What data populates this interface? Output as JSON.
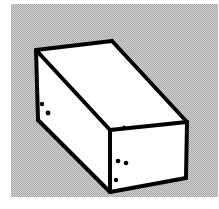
{
  "figure": {
    "subject_name": "rectangular-cuboid",
    "style": "black-ink-outline-on-halftone-gray",
    "canvas": {
      "width": 219,
      "height": 209
    },
    "colors": {
      "page_background": "#ffffff",
      "plate_background": "#c9c9c9",
      "halftone_dot": "#a8a8a8",
      "outline": "#000000",
      "face_fill": "#ffffff",
      "speckle": "#000000"
    },
    "plate": {
      "x": 11,
      "y": 4,
      "width": 207,
      "height": 193
    },
    "outline_width": 4,
    "vertices": {
      "top_back_left": [
        36,
        50
      ],
      "top_back_right": [
        112,
        41
      ],
      "top_front_right": [
        187,
        122
      ],
      "top_front_center": [
        110,
        130
      ],
      "bottom_left": [
        38,
        120
      ],
      "bottom_front_center": [
        110,
        192
      ],
      "bottom_right": [
        186,
        178
      ]
    },
    "faces": [
      {
        "name": "top-face",
        "label": "Top face",
        "points": "36,50 112,41 187,122 110,130",
        "fill": "#ffffff"
      },
      {
        "name": "left-face",
        "label": "Left long side face",
        "points": "36,50 110,130 110,192 38,120",
        "fill": "#ffffff"
      },
      {
        "name": "right-face",
        "label": "Right end face",
        "points": "110,130 187,122 186,178 110,192",
        "fill": "#ffffff"
      }
    ],
    "edges": [
      {
        "name": "edge-top-back",
        "label": "Top back edge",
        "d": "M36,50 L112,41"
      },
      {
        "name": "edge-top-right",
        "label": "Top right edge",
        "d": "M112,41 L187,122"
      },
      {
        "name": "edge-top-front-right",
        "label": "Top front right edge",
        "d": "M187,122 L110,130"
      },
      {
        "name": "edge-top-front-left",
        "label": "Top front left edge",
        "d": "M110,130 L36,50"
      },
      {
        "name": "edge-left-vertical",
        "label": "Left vertical edge",
        "d": "M36,50 L38,120"
      },
      {
        "name": "edge-bottom-left",
        "label": "Bottom left edge",
        "d": "M38,120 L110,192"
      },
      {
        "name": "edge-center-vertical",
        "label": "Center vertical edge",
        "d": "M110,130 L110,192"
      },
      {
        "name": "edge-bottom-right",
        "label": "Bottom right edge",
        "d": "M110,192 L186,178"
      },
      {
        "name": "edge-right-vertical",
        "label": "Right vertical edge",
        "d": "M186,178 L187,122"
      }
    ],
    "speckles": [
      {
        "name": "speckle-left-1",
        "cx": 42,
        "cy": 104,
        "r": 2.2
      },
      {
        "name": "speckle-left-2",
        "cx": 48,
        "cy": 113,
        "r": 2.4
      },
      {
        "name": "speckle-front-1",
        "cx": 118,
        "cy": 161,
        "r": 2.3
      },
      {
        "name": "speckle-front-2",
        "cx": 126,
        "cy": 163,
        "r": 2.3
      },
      {
        "name": "speckle-front-3",
        "cx": 116,
        "cy": 180,
        "r": 2.2
      },
      {
        "name": "speckle-top-1",
        "cx": 124,
        "cy": 127,
        "r": 1.6
      }
    ]
  }
}
